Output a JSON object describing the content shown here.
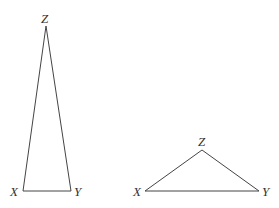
{
  "triangles": [
    {
      "name": "tall-triangle",
      "vertices": {
        "Z": {
          "label": "Z",
          "x": 46,
          "y": 26
        },
        "X": {
          "label": "X",
          "x": 23,
          "y": 191
        },
        "Y": {
          "label": "Y",
          "x": 71,
          "y": 191
        }
      }
    },
    {
      "name": "wide-triangle",
      "vertices": {
        "Z": {
          "label": "Z",
          "x": 202,
          "y": 150
        },
        "X": {
          "label": "X",
          "x": 145,
          "y": 191
        },
        "Y": {
          "label": "Y",
          "x": 259,
          "y": 191
        }
      }
    }
  ]
}
